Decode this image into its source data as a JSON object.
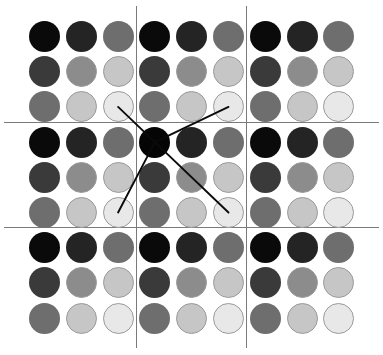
{
  "figure": {
    "width": 383,
    "height": 355,
    "background": "#ffffff"
  },
  "chart_data": {
    "type": "heatmap",
    "title": "",
    "subtitle": "",
    "xlabel": "",
    "ylabel": "",
    "grid": true,
    "legend": "none",
    "rows": 9,
    "cols": 9,
    "block_rows": 3,
    "block_cols": 3,
    "shade_levels": [
      {
        "level": 0,
        "color": "#0a0a0a",
        "name": "black"
      },
      {
        "level": 1,
        "color": "#242424",
        "name": "near-black"
      },
      {
        "level": 2,
        "color": "#3a3a3a",
        "name": "very-dark-gray"
      },
      {
        "level": 3,
        "color": "#4f4f4f",
        "name": "dark-gray"
      },
      {
        "level": 4,
        "color": "#6e6e6e",
        "name": "medium-dark-gray"
      },
      {
        "level": 5,
        "color": "#8c8c8c",
        "name": "medium-gray"
      },
      {
        "level": 6,
        "color": "#a8a8a8",
        "name": "light-medium-gray"
      },
      {
        "level": 7,
        "color": "#c6c6c6",
        "name": "light-gray"
      },
      {
        "level": 8,
        "color": "#e8e8e8",
        "name": "near-white"
      }
    ],
    "block_pattern": [
      [
        0,
        1,
        4
      ],
      [
        2,
        5,
        7
      ],
      [
        4,
        7,
        8
      ]
    ],
    "cell_values": [
      [
        0,
        1,
        4,
        0,
        1,
        4,
        0,
        1,
        4
      ],
      [
        2,
        5,
        7,
        2,
        5,
        7,
        2,
        5,
        7
      ],
      [
        4,
        7,
        8,
        4,
        7,
        8,
        4,
        7,
        8
      ],
      [
        0,
        1,
        4,
        0,
        1,
        4,
        0,
        1,
        4
      ],
      [
        2,
        5,
        7,
        2,
        5,
        7,
        2,
        5,
        7
      ],
      [
        4,
        7,
        8,
        4,
        7,
        8,
        4,
        7,
        8
      ],
      [
        0,
        1,
        4,
        0,
        1,
        4,
        0,
        1,
        4
      ],
      [
        2,
        5,
        7,
        2,
        5,
        7,
        2,
        5,
        7
      ],
      [
        4,
        7,
        8,
        4,
        7,
        8,
        4,
        7,
        8
      ]
    ],
    "center_node": {
      "row": 3,
      "col": 3,
      "color": "#050505",
      "label": ""
    },
    "links": [
      {
        "from_row": 3,
        "from_col": 3,
        "to_row": 2,
        "to_col": 2
      },
      {
        "from_row": 3,
        "from_col": 3,
        "to_row": 2,
        "to_col": 5
      },
      {
        "from_row": 3,
        "from_col": 3,
        "to_row": 5,
        "to_col": 2
      },
      {
        "from_row": 3,
        "from_col": 3,
        "to_row": 5,
        "to_col": 5
      }
    ],
    "geometry": {
      "origin_x": 29,
      "origin_y": 21,
      "cell_w": 36.8,
      "cell_h": 35.2,
      "dot_diameter": 31,
      "block_line_color": "#7a7a7a",
      "block_line_width": 1,
      "link_color": "#0b0b0b",
      "link_width": 1.9
    },
    "gridlines": {
      "horizontal_y": [
        122,
        227
      ],
      "vertical_x": [
        136,
        246
      ]
    }
  }
}
